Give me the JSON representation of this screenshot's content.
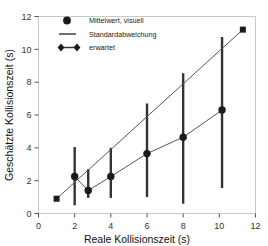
{
  "chart_data": {
    "type": "scatter",
    "title": "",
    "xlabel": "Reale Kollisionszeit (s)",
    "ylabel": "Geschätzte Kollisionszeit (s)",
    "xlim": [
      0,
      12
    ],
    "ylim": [
      0,
      12
    ],
    "xticks": [
      0,
      2,
      4,
      6,
      8,
      10,
      12
    ],
    "yticks": [
      0,
      2,
      4,
      6,
      8,
      10,
      12
    ],
    "xtick_labels": [
      "0",
      "2",
      "4",
      "6",
      "8",
      "10",
      "12"
    ],
    "ytick_labels": [
      "0",
      "2",
      "4",
      "6",
      "8",
      "10",
      "12"
    ],
    "grid": false,
    "legend_position": "top-left-inside",
    "series": [
      {
        "name": "Mittelwert, visuell",
        "marker": "filled-circle",
        "color": "#1a1a1a",
        "x": [
          2.0,
          2.75,
          4.0,
          6.0,
          8.0,
          10.15
        ],
        "y": [
          2.25,
          1.4,
          2.25,
          3.65,
          4.65,
          6.3
        ],
        "yerr_low": [
          0.5,
          0.95,
          0.95,
          1.0,
          0.6,
          1.55
        ],
        "yerr_high": [
          4.05,
          2.7,
          4.0,
          6.7,
          8.55,
          10.75
        ]
      },
      {
        "name": "erwartet",
        "marker": "filled-square",
        "color": "#444444",
        "x": [
          1.0,
          11.3
        ],
        "y": [
          0.9,
          11.2
        ]
      }
    ],
    "errorbar_label": "Standardabweichung",
    "legend": [
      {
        "label": "Mittelwert, visuell",
        "symbol": "filled-circle"
      },
      {
        "label": "Standardabweichung",
        "symbol": "vertical-line"
      },
      {
        "label": "erwartet",
        "symbol": "diamond-line-diamond"
      }
    ]
  },
  "colors": {
    "data": "#1a1a1a",
    "errorbar": "#333333",
    "expected_line": "#555555",
    "frame": "#c9c9c9",
    "text": "#111111"
  }
}
